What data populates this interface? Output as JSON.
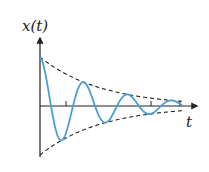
{
  "figure": {
    "y_axis_label": "x(t)",
    "x_axis_label": "t"
  },
  "colors": {
    "curve": "#4a9fd4",
    "axes": "#222222",
    "envelope": "#222222",
    "background": "#ffffff"
  },
  "geometry": {
    "origin_x": 40,
    "axis_y": 106,
    "y_axis_top": 38,
    "y_axis_bottom": 157,
    "x_axis_end": 197,
    "initial_amplitude": 49,
    "decay_per_px": 0.0165,
    "half_period_px": 22,
    "curve_end_x": 182,
    "envelope_end_x": 182,
    "ticks_x": [
      66,
      151,
      180
    ]
  }
}
